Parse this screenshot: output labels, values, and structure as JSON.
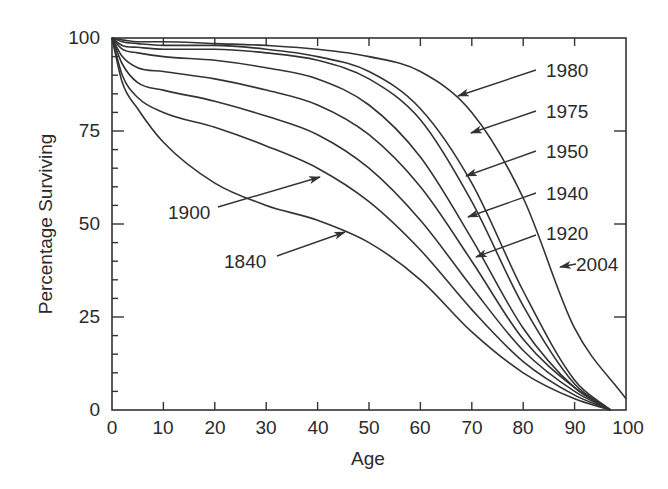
{
  "chart_data": {
    "type": "line",
    "title": "",
    "xlabel": "Age",
    "ylabel": "Percentage Surviving",
    "xlim": [
      0,
      100
    ],
    "ylim": [
      0,
      100
    ],
    "grid": false,
    "legend": "inline arrow annotations",
    "x_ticks": [
      0,
      10,
      20,
      30,
      40,
      50,
      60,
      70,
      80,
      90,
      100
    ],
    "y_ticks": [
      0,
      25,
      50,
      75,
      100
    ],
    "series": [
      {
        "name": "1840",
        "x": [
          0,
          2,
          5,
          10,
          20,
          30,
          40,
          50,
          60,
          70,
          80,
          90,
          97
        ],
        "values": [
          100,
          88,
          81,
          72,
          61,
          55,
          51,
          45,
          35,
          21,
          10,
          3,
          0
        ]
      },
      {
        "name": "1900",
        "x": [
          0,
          2,
          5,
          10,
          20,
          30,
          40,
          50,
          60,
          70,
          80,
          90,
          97
        ],
        "values": [
          100,
          90,
          84,
          80,
          76,
          71,
          65,
          56,
          43,
          27,
          13,
          4,
          0
        ]
      },
      {
        "name": "1920",
        "x": [
          0,
          2,
          5,
          10,
          20,
          30,
          40,
          50,
          60,
          70,
          80,
          90,
          97
        ],
        "values": [
          100,
          93,
          88,
          86,
          83,
          79,
          74,
          65,
          51,
          33,
          16,
          5,
          0
        ]
      },
      {
        "name": "1940",
        "x": [
          0,
          2,
          5,
          10,
          20,
          30,
          40,
          50,
          60,
          70,
          80,
          90,
          97
        ],
        "values": [
          100,
          95,
          92,
          91,
          89,
          86,
          82,
          74,
          60,
          40,
          19,
          6,
          0
        ]
      },
      {
        "name": "1950",
        "x": [
          0,
          2,
          5,
          10,
          20,
          30,
          40,
          50,
          60,
          70,
          80,
          90,
          97
        ],
        "values": [
          100,
          97,
          96,
          95,
          94,
          92,
          89,
          82,
          68,
          46,
          22,
          6,
          0
        ]
      },
      {
        "name": "1975",
        "x": [
          0,
          2,
          5,
          10,
          20,
          30,
          40,
          50,
          60,
          70,
          80,
          90,
          97
        ],
        "values": [
          100,
          98,
          97.5,
          97,
          97,
          96,
          94,
          89,
          78,
          56,
          28,
          7,
          0
        ]
      },
      {
        "name": "1980",
        "x": [
          0,
          2,
          5,
          10,
          20,
          30,
          40,
          50,
          60,
          70,
          80,
          90,
          97
        ],
        "values": [
          100,
          99,
          98.5,
          98,
          98,
          97,
          95,
          91,
          81,
          61,
          32,
          8,
          0
        ]
      },
      {
        "name": "2004",
        "x": [
          0,
          2,
          5,
          10,
          20,
          30,
          40,
          50,
          60,
          70,
          80,
          90,
          100
        ],
        "values": [
          100,
          99.5,
          99,
          99,
          98.5,
          98,
          97,
          95,
          91,
          80,
          57,
          22,
          3
        ]
      }
    ],
    "annotations": [
      {
        "text": "1840",
        "points_to_series": "1840"
      },
      {
        "text": "1900",
        "points_to_series": "1900"
      },
      {
        "text": "1920",
        "points_to_series": "1920"
      },
      {
        "text": "1940",
        "points_to_series": "1940"
      },
      {
        "text": "1950",
        "points_to_series": "1950"
      },
      {
        "text": "1975",
        "points_to_series": "1975"
      },
      {
        "text": "1980",
        "points_to_series": "1980"
      },
      {
        "text": "2004",
        "points_to_series": "2004"
      }
    ]
  },
  "axes": {
    "xlabel": "Age",
    "ylabel": "Percentage Surviving",
    "x_tick_labels": [
      "0",
      "10",
      "20",
      "30",
      "40",
      "50",
      "60",
      "70",
      "80",
      "90",
      "100"
    ],
    "y_tick_labels": [
      "0",
      "25",
      "50",
      "75",
      "100"
    ]
  },
  "labels": {
    "l1840": "1840",
    "l1900": "1900",
    "l1920": "1920",
    "l1940": "1940",
    "l1950": "1950",
    "l1975": "1975",
    "l1980": "1980",
    "l2004": "2004"
  },
  "colors": {
    "line": "#333333",
    "background": "#ffffff"
  }
}
